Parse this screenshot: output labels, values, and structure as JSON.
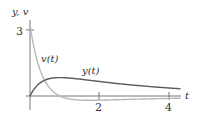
{
  "chart_data": {
    "type": "line",
    "title": "",
    "xlabel": "t",
    "ylabel": "y, v",
    "x_ticks": [
      "2",
      "4"
    ],
    "y_ticks": [
      "3"
    ],
    "xlim": [
      0,
      4.4
    ],
    "ylim": [
      -0.4,
      3.4
    ],
    "grid": false,
    "legend": "inline labels",
    "series": [
      {
        "name": "y(t)",
        "color": "#5a5a5a",
        "x": [
          0,
          0.2,
          0.4,
          0.6,
          0.8,
          1.0,
          1.5,
          2.0,
          2.5,
          3.0,
          3.5,
          4.0,
          4.3
        ],
        "values": [
          0,
          0.54,
          0.74,
          0.82,
          0.84,
          0.83,
          0.76,
          0.66,
          0.57,
          0.49,
          0.42,
          0.36,
          0.33
        ]
      },
      {
        "name": "v(t)",
        "color": "#b5b5b5",
        "x": [
          0,
          0.2,
          0.4,
          0.6,
          0.8,
          1.0,
          1.5,
          2.0,
          2.5,
          3.0,
          3.5,
          4.0,
          4.3
        ],
        "values": [
          3.24,
          1.69,
          0.74,
          0.23,
          -0.04,
          -0.17,
          -0.2,
          -0.2,
          -0.17,
          -0.15,
          -0.13,
          -0.11,
          -0.1
        ]
      }
    ],
    "annotations": [
      {
        "text": "v(t)",
        "x": 0.55,
        "y": 2.3
      },
      {
        "text": "y(t)",
        "x": 1.6,
        "y": 1.2
      }
    ]
  },
  "labels": {
    "y_axis": "y, v",
    "x_axis": "t",
    "tick_3": "3",
    "tick_2": "2",
    "tick_4": "4",
    "curve_v": "v(t)",
    "curve_y": "y(t)"
  }
}
